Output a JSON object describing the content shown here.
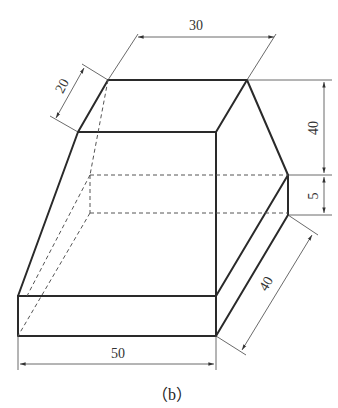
{
  "figure": {
    "caption": "（b）"
  },
  "dimensions": {
    "top_width": "30",
    "top_depth": "20",
    "upper_height": "40",
    "step_height": "5",
    "base_depth": "40",
    "base_width": "50"
  },
  "colors": {
    "line": "#2a2a2a",
    "hidden_line": "#555555",
    "background": "#ffffff"
  }
}
